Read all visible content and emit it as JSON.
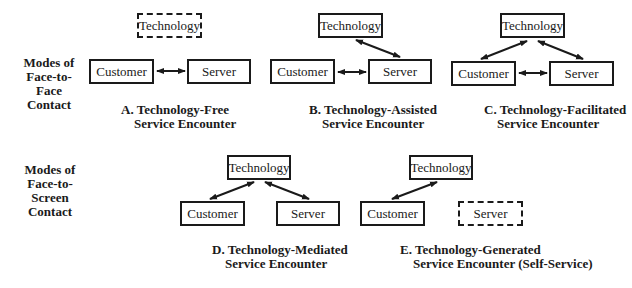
{
  "row_labels": {
    "face_to_face": [
      "Modes of",
      "Face-to-Face",
      "Contact"
    ],
    "face_to_screen": [
      "Modes of",
      "Face-to-Screen",
      "Contact"
    ]
  },
  "nodes": {
    "technology": "Technology",
    "customer": "Customer",
    "server": "Server"
  },
  "panels": [
    {
      "id": "A",
      "caption_line1": "A. Technology-Free",
      "caption_line2": "Service Encounter",
      "technology_present": false,
      "server_present": true
    },
    {
      "id": "B",
      "caption_line1": "B. Technology-Assisted",
      "caption_line2": "Service Encounter",
      "technology_present": true,
      "server_present": true
    },
    {
      "id": "C",
      "caption_line1": "C. Technology-Facilitated",
      "caption_line2": "Service Encounter",
      "technology_present": true,
      "server_present": true
    },
    {
      "id": "D",
      "caption_line1": "D. Technology-Mediated",
      "caption_line2": "Service Encounter",
      "technology_present": true,
      "server_present": true
    },
    {
      "id": "E",
      "caption_line1": "E. Technology-Generated",
      "caption_line2": "Service Encounter (Self-Service)",
      "technology_present": true,
      "server_present": false
    }
  ],
  "colors": {
    "stroke": "#1a1a1a",
    "background": "#ffffff"
  }
}
